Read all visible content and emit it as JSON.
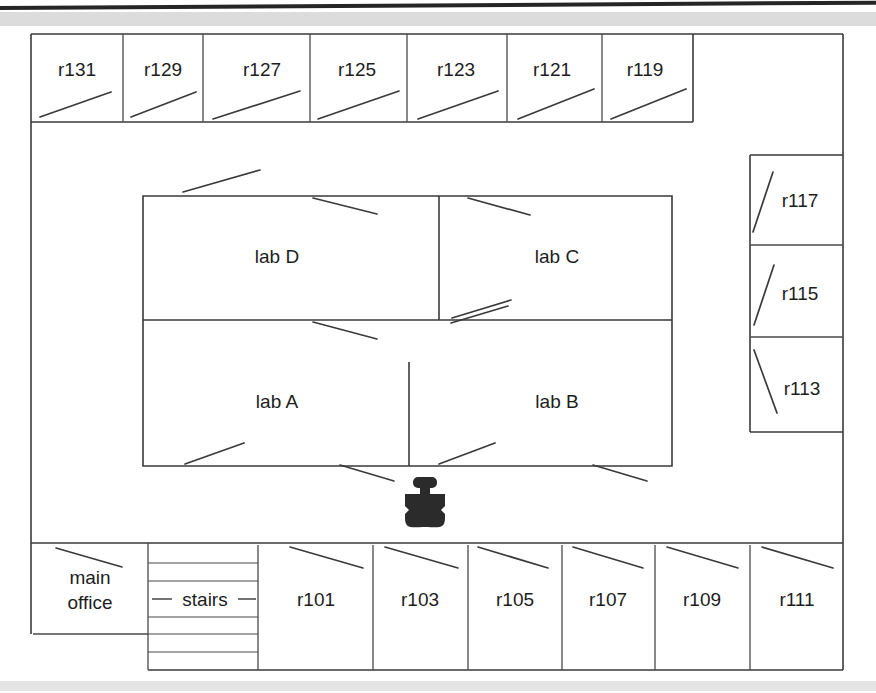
{
  "diagram": {
    "type": "floor-plan",
    "line_color": "#3a3a3a",
    "background_color": "#ffffff",
    "robot_color": "#2b2b2b"
  },
  "top_rooms": [
    {
      "id": "r131",
      "label": "r131",
      "x": 31,
      "y": 34,
      "w": 92,
      "h": 88,
      "door": "up-right"
    },
    {
      "id": "r129",
      "label": "r129",
      "x": 123,
      "y": 34,
      "w": 80,
      "h": 88,
      "door": "up-right"
    },
    {
      "id": "r127",
      "label": "r127",
      "x": 203,
      "y": 34,
      "w": 107,
      "h": 88,
      "door": "up-right"
    },
    {
      "id": "r125",
      "label": "r125",
      "x": 310,
      "y": 34,
      "w": 97,
      "h": 88,
      "door": "up-right"
    },
    {
      "id": "r123",
      "label": "r123",
      "x": 407,
      "y": 34,
      "w": 100,
      "h": 88,
      "door": "up-right"
    },
    {
      "id": "r121",
      "label": "r121",
      "x": 507,
      "y": 34,
      "w": 95,
      "h": 88,
      "door": "up-right"
    },
    {
      "id": "r119",
      "label": "r119",
      "x": 602,
      "y": 34,
      "w": 91,
      "h": 88,
      "door": "up-right"
    }
  ],
  "right_rooms": [
    {
      "id": "r117",
      "label": "r117",
      "x": 750,
      "y": 155,
      "w": 93,
      "h": 90,
      "door": "up-right-steep"
    },
    {
      "id": "r115",
      "label": "r115",
      "x": 750,
      "y": 245,
      "w": 93,
      "h": 92,
      "door": "up-right-steep"
    },
    {
      "id": "r113",
      "label": "r113",
      "x": 750,
      "y": 337,
      "w": 93,
      "h": 95,
      "door": "down-right-steep"
    }
  ],
  "labs": [
    {
      "id": "labD",
      "label": "lab D",
      "x": 143,
      "y": 196,
      "w": 296,
      "h": 124
    },
    {
      "id": "labC",
      "label": "lab C",
      "x": 439,
      "y": 196,
      "w": 233,
      "h": 124
    },
    {
      "id": "labA",
      "label": "lab A",
      "x": 143,
      "y": 320,
      "w": 296,
      "h": 146
    },
    {
      "id": "labB",
      "label": "lab B",
      "x": 439,
      "y": 320,
      "w": 233,
      "h": 146
    }
  ],
  "bottom_rooms": [
    {
      "id": "main-office",
      "label_line1": "main",
      "label_line2": "office",
      "x": 33,
      "y": 543,
      "w": 115,
      "h": 91,
      "door": "down-right"
    },
    {
      "id": "stairs",
      "label": "stairs",
      "x": 148,
      "y": 545,
      "w": 110,
      "h": 125,
      "steps": 7
    },
    {
      "id": "r101",
      "label": "r101",
      "x": 258,
      "y": 545,
      "w": 115,
      "h": 125,
      "door": "down-right"
    },
    {
      "id": "r103",
      "label": "r103",
      "x": 373,
      "y": 545,
      "w": 95,
      "h": 125,
      "door": "down-right"
    },
    {
      "id": "r105",
      "label": "r105",
      "x": 468,
      "y": 545,
      "w": 94,
      "h": 125,
      "door": "down-right"
    },
    {
      "id": "r107",
      "label": "r107",
      "x": 562,
      "y": 545,
      "w": 93,
      "h": 125,
      "door": "down-right"
    },
    {
      "id": "r109",
      "label": "r109",
      "x": 655,
      "y": 545,
      "w": 95,
      "h": 125,
      "door": "down-right"
    },
    {
      "id": "r111",
      "label": "r111",
      "x": 750,
      "y": 545,
      "w": 95,
      "h": 125,
      "door": "down-right"
    }
  ],
  "robot": {
    "name": "robot-marker",
    "x": 405,
    "y": 477,
    "w": 44,
    "h": 50
  },
  "outer_wall": {
    "x": 31,
    "y": 34,
    "right": 843,
    "bottom": 543
  }
}
